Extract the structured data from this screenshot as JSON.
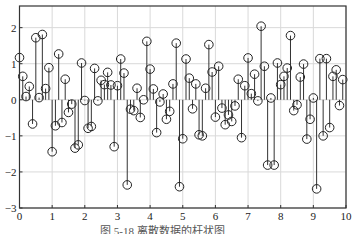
{
  "caption": "图 5-18  离散数据的杆状图",
  "colors": {
    "stem": "#333333",
    "marker_edge": "#222222",
    "grid": "#d9d9d9",
    "axis": "#333333",
    "background": "#ffffff"
  },
  "chart_data": {
    "type": "stem",
    "title": "",
    "xlabel": "",
    "ylabel": "",
    "xlim": [
      0,
      10
    ],
    "ylim": [
      -3,
      2.6
    ],
    "xticks": [
      0,
      1,
      2,
      3,
      4,
      5,
      6,
      7,
      8,
      9,
      10
    ],
    "yticks": [
      -3,
      -2,
      -1,
      0,
      1,
      2
    ],
    "grid": true,
    "marker": "open-circle",
    "x_step": 0.1,
    "x_start": 0,
    "values": [
      1.17,
      0.65,
      0.09,
      0.37,
      -0.67,
      1.72,
      0.06,
      1.81,
      0.31,
      0.89,
      -1.44,
      -0.72,
      1.27,
      -0.63,
      0.57,
      -0.35,
      -0.12,
      -1.34,
      -1.25,
      1.02,
      -0.02,
      -0.79,
      -0.74,
      0.87,
      -0.03,
      0.54,
      0.42,
      0.76,
      0.41,
      -1.3,
      0.39,
      1.13,
      0.74,
      -2.36,
      -0.26,
      -0.3,
      0.32,
      -0.49,
      0.0,
      1.62,
      0.85,
      0.3,
      -0.91,
      -0.06,
      0.16,
      -0.54,
      -0.32,
      0.44,
      1.57,
      -2.41,
      -1.08,
      1.13,
      0.6,
      -0.25,
      0.44,
      -0.97,
      -1.0,
      0.32,
      1.53,
      0.77,
      -0.48,
      0.93,
      -0.23,
      -0.69,
      -0.42,
      -0.6,
      -0.17,
      0.57,
      -1.05,
      0.39,
      1.16,
      0.17,
      0.71,
      -0.03,
      2.04,
      0.93,
      -1.81,
      0.05,
      -1.81,
      1.02,
      0.42,
      0.65,
      0.88,
      1.78,
      -0.3,
      -0.14,
      0.63,
      0.99,
      -1.09,
      -0.54,
      0.05,
      -2.47,
      1.14,
      -1.0,
      1.14,
      -0.77,
      0.65,
      0.83,
      -0.16,
      0.56
    ]
  }
}
